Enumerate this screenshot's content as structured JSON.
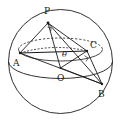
{
  "figure": {
    "kind": "sphere-geometry-diagram",
    "background_color": "#ffffff",
    "stroke_color": "#1a1a1a",
    "canvas": {
      "width": 121,
      "height": 123
    }
  },
  "sphere": {
    "name": "sphere-outline",
    "center": {
      "x": 60.5,
      "y": 61.5
    },
    "radius": 52,
    "equator": {
      "name": "equator-ellipse",
      "rx": 52,
      "ry": 17,
      "cx": 60.5,
      "cy": 61.5
    },
    "upper_small_circle": {
      "name": "upper-circle-through-abc",
      "cx": 60.5,
      "cy": 47.5,
      "rx": 42,
      "ry": 11.5,
      "front_style": "solid",
      "back_style": "dashed"
    }
  },
  "points": [
    {
      "id": "P",
      "label": "P",
      "x": 48,
      "y": 23,
      "label_x": 44,
      "label_y": 13,
      "role": "apex"
    },
    {
      "id": "A",
      "label": "A",
      "x": 20,
      "y": 53,
      "label_x": 14,
      "label_y": 65,
      "role": "base-vertex"
    },
    {
      "id": "B",
      "label": "B",
      "x": 102,
      "y": 84,
      "label_x": 99,
      "label_y": 96,
      "role": "base-vertex"
    },
    {
      "id": "C",
      "label": "C",
      "x": 87,
      "y": 51,
      "label_x": 90,
      "label_y": 47,
      "role": "base-vertex"
    },
    {
      "id": "O",
      "label": "O",
      "x": 60.5,
      "y": 68,
      "label_x": 58,
      "label_y": 80,
      "role": "sphere-center"
    }
  ],
  "segments": [
    {
      "name": "segment-PA",
      "from": "P",
      "to": "A",
      "style": "solid"
    },
    {
      "name": "segment-PB",
      "from": "P",
      "to": "B",
      "style": "solid"
    },
    {
      "name": "segment-PC",
      "from": "P",
      "to": "C",
      "style": "solid"
    },
    {
      "name": "segment-PO",
      "from": "P",
      "to": "O",
      "style": "solid"
    },
    {
      "name": "segment-AC",
      "from": "A",
      "to": "C",
      "style": "solid"
    },
    {
      "name": "segment-AB",
      "from": "A",
      "to": "B",
      "style": "solid"
    },
    {
      "name": "segment-CB",
      "from": "C",
      "to": "B",
      "style": "solid"
    },
    {
      "name": "segment-OB",
      "from": "O",
      "to": "B",
      "style": "solid"
    },
    {
      "name": "segment-OC",
      "from": "O",
      "to": "C",
      "style": "solid"
    },
    {
      "name": "segment-AC-arc-dashed",
      "from": "A",
      "to": "C",
      "style": "dashed"
    }
  ],
  "angles": [
    {
      "name": "angle-theta-at-O",
      "label": "θ",
      "at": "O",
      "label_x": 63,
      "label_y": 56
    },
    {
      "name": "right-angle-at-C",
      "label": "",
      "at": "C",
      "marker": "square"
    },
    {
      "name": "right-angle-at-P",
      "label": "",
      "at": "P",
      "marker": "square"
    }
  ]
}
